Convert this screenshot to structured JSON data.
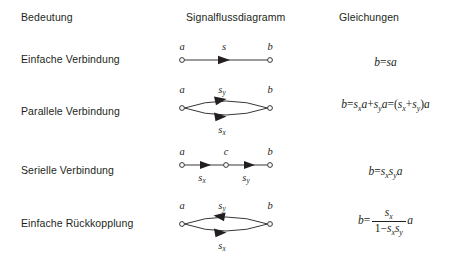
{
  "headers": {
    "meaning": "Bedeutung",
    "diagram": "Signalflussdiagramm",
    "equations": "Gleichungen"
  },
  "rows": [
    {
      "label": "Einfache Verbindung",
      "diagram": {
        "kind": "series-single",
        "nodes": [
          "a",
          "b"
        ],
        "edge_labels": [
          "s"
        ]
      },
      "equation": {
        "kind": "plain",
        "text": "b = sa",
        "parts": {
          "lhs": "b",
          "eq": "=",
          "rhs_gain": "s",
          "rhs_input": "a"
        }
      }
    },
    {
      "label": "Parallele Verbindung",
      "diagram": {
        "kind": "parallel",
        "nodes": [
          "a",
          "b"
        ],
        "top_label_base": "s",
        "top_label_sub": "y",
        "top_direction": "right",
        "bottom_label_base": "s",
        "bottom_label_sub": "x",
        "bottom_direction": "right"
      },
      "equation": {
        "kind": "plain",
        "text": "b = s_x a + s_y a = (s_x + s_y) a",
        "parts": {
          "lhs": "b",
          "eq": "=",
          "term1_base": "s",
          "term1_sub": "x",
          "term1_var": "a",
          "plus": "+",
          "term2_base": "s",
          "term2_sub": "y",
          "term2_var": "a",
          "eq2": "=",
          "open": "(",
          "term3_base": "s",
          "term3_sub": "x",
          "plus2": "+",
          "term4_base": "s",
          "term4_sub": "y",
          "close": ")",
          "tail_var": "a"
        }
      }
    },
    {
      "label": "Serielle Verbindung",
      "diagram": {
        "kind": "series-double",
        "nodes": [
          "a",
          "c",
          "b"
        ],
        "edge1_base": "s",
        "edge1_sub": "x",
        "edge2_base": "s",
        "edge2_sub": "y"
      },
      "equation": {
        "kind": "plain",
        "text": "b = s_x s_y a",
        "parts": {
          "lhs": "b",
          "eq": "=",
          "g1_base": "s",
          "g1_sub": "x",
          "g2_base": "s",
          "g2_sub": "y",
          "var": "a"
        }
      }
    },
    {
      "label": "Einfache Rückkopplung",
      "diagram": {
        "kind": "feedback",
        "nodes": [
          "a",
          "b"
        ],
        "top_label_base": "s",
        "top_label_sub": "y",
        "top_direction": "left",
        "bottom_label_base": "s",
        "bottom_label_sub": "x",
        "bottom_direction": "right"
      },
      "equation": {
        "kind": "fraction",
        "text": "b = s_x / (1 - s_x s_y) · a",
        "parts": {
          "lhs": "b",
          "eq": "=",
          "num_base": "s",
          "num_sub": "x",
          "den_one": "1",
          "den_minus": "−",
          "den_g1_base": "s",
          "den_g1_sub": "x",
          "den_g2_base": "s",
          "den_g2_sub": "y",
          "tail_var": "a"
        }
      }
    }
  ],
  "colors": {
    "ink": "#231f20",
    "paper": "#ffffff"
  }
}
